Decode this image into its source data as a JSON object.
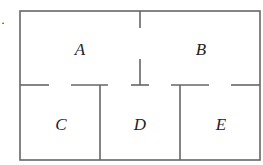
{
  "diagram": {
    "type": "floor-plan",
    "marker": "·",
    "rooms": [
      {
        "id": "A",
        "label": "A",
        "x": 80,
        "y": 49
      },
      {
        "id": "B",
        "label": "B",
        "x": 201,
        "y": 49
      },
      {
        "id": "C",
        "label": "C",
        "x": 60,
        "y": 124
      },
      {
        "id": "D",
        "label": "D",
        "x": 140,
        "y": 124
      },
      {
        "id": "E",
        "label": "E",
        "x": 220,
        "y": 124
      }
    ]
  }
}
